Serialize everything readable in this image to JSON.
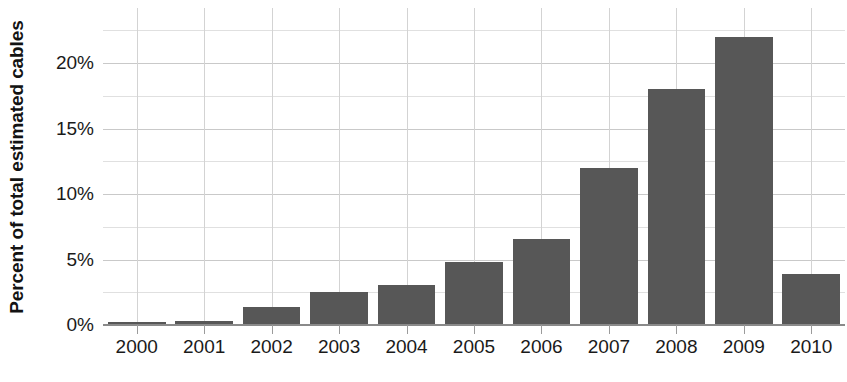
{
  "chart_data": {
    "type": "bar",
    "title": "",
    "xlabel": "",
    "ylabel": "Percent of total estimated cables",
    "categories": [
      "2000",
      "2001",
      "2002",
      "2003",
      "2004",
      "2005",
      "2006",
      "2007",
      "2008",
      "2009",
      "2010"
    ],
    "values": [
      0.2,
      0.3,
      1.35,
      2.5,
      3.05,
      4.8,
      6.6,
      12.0,
      18.0,
      22.0,
      3.9
    ],
    "ylim": [
      0,
      24.2
    ],
    "y_tick_values": [
      0,
      5,
      10,
      15,
      20
    ],
    "y_tick_labels": [
      "0%",
      "5%",
      "10%",
      "15%",
      "20%"
    ],
    "y_minor_tick_values": [
      2.5,
      7.5,
      12.5,
      17.5,
      22.5
    ],
    "grid": true,
    "legend": "none",
    "bar_color": "#575757",
    "gridline_color": "#c9c9c9",
    "minor_gridline_color": "#e0e0e0",
    "axis_color": "#8a8a8a",
    "text_color": "#1a1a1a"
  }
}
